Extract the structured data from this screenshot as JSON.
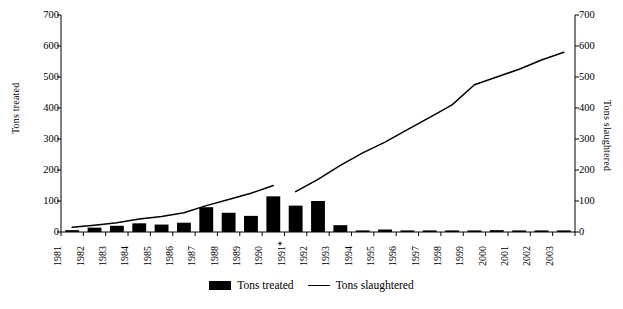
{
  "chart_data": {
    "type": "bar",
    "title": "",
    "xlabel": "",
    "categories": [
      "1981",
      "1982",
      "1983",
      "1984",
      "1985",
      "1986",
      "1987",
      "1988",
      "1989",
      "1990",
      "1991*",
      "1992",
      "1993",
      "1994",
      "1995",
      "1996",
      "1997",
      "1998",
      "1999",
      "2000",
      "2001",
      "2002",
      "2003"
    ],
    "grid": false,
    "legend_position": "bottom-center",
    "series": [
      {
        "name": "Tons treated",
        "type": "bar",
        "axis": "left",
        "ylabel": "Tons treated",
        "ylim": [
          0,
          700
        ],
        "yticks": [
          0,
          100,
          200,
          300,
          400,
          500,
          600,
          700
        ],
        "color": "#000000",
        "values": [
          6,
          14,
          20,
          28,
          24,
          30,
          80,
          62,
          52,
          115,
          85,
          100,
          22,
          4,
          8,
          3,
          3,
          3,
          3,
          6,
          3,
          4,
          3
        ]
      },
      {
        "name": "Tons slaughtered",
        "type": "line",
        "axis": "right",
        "ylabel": "Tons slaughtered",
        "ylim": [
          0,
          700
        ],
        "yticks": [
          0,
          100,
          200,
          300,
          400,
          500,
          600,
          700
        ],
        "color": "#000000",
        "values": [
          15,
          22,
          30,
          42,
          50,
          62,
          85,
          105,
          125,
          150,
          130,
          170,
          215,
          255,
          290,
          330,
          370,
          410,
          475,
          500,
          525,
          555,
          580
        ],
        "break_after": "1990"
      }
    ]
  },
  "axes": {
    "left": {
      "title": "Tons treated",
      "ticks": [
        "0",
        "100",
        "200",
        "300",
        "400",
        "500",
        "600",
        "700"
      ]
    },
    "right": {
      "title": "Tons slaughtered",
      "ticks": [
        "0",
        "100",
        "200",
        "300",
        "400",
        "500",
        "600",
        "700"
      ]
    },
    "x": {
      "ticks": [
        "1981",
        "1982",
        "1983",
        "1984",
        "1985",
        "1986",
        "1987",
        "1988",
        "1989",
        "1990",
        "1991*",
        "1992",
        "1993",
        "1994",
        "1995",
        "1996",
        "1997",
        "1998",
        "1999",
        "2000",
        "2001",
        "2002",
        "2003"
      ]
    }
  },
  "legend": {
    "items": [
      {
        "label": "Tons treated",
        "marker": "bar-swatch",
        "color": "#000000"
      },
      {
        "label": "Tons slaughtered",
        "marker": "line-swatch",
        "color": "#000000"
      }
    ]
  }
}
